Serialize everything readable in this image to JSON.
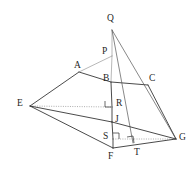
{
  "figure": {
    "background_color": "#ffffff",
    "stroke_color": "#2b2b2b",
    "light_stroke_color": "#9a9a9a",
    "width": 196,
    "height": 169,
    "points": [
      {
        "id": "Q",
        "label": "Q",
        "x": 112,
        "y": 30,
        "label_x": 107,
        "label_y": 14
      },
      {
        "id": "P",
        "label": "P",
        "x": 112,
        "y": 56,
        "label_x": 102,
        "label_y": 47
      },
      {
        "id": "A",
        "label": "A",
        "x": 79,
        "y": 72,
        "label_x": 74,
        "label_y": 61
      },
      {
        "id": "B",
        "label": "B",
        "x": 111,
        "y": 82,
        "label_x": 103,
        "label_y": 74
      },
      {
        "id": "C",
        "label": "C",
        "x": 148,
        "y": 85,
        "label_x": 149,
        "label_y": 74
      },
      {
        "id": "E",
        "label": "E",
        "x": 30,
        "y": 106,
        "label_x": 17,
        "label_y": 99
      },
      {
        "id": "R",
        "label": "R",
        "x": 112,
        "y": 107,
        "label_x": 116,
        "label_y": 99
      },
      {
        "id": "J",
        "label": "J",
        "x": 112,
        "y": 122,
        "label_x": 115,
        "label_y": 115
      },
      {
        "id": "S",
        "label": "S",
        "x": 113,
        "y": 139,
        "label_x": 103,
        "label_y": 132
      },
      {
        "id": "G",
        "label": "G",
        "x": 176,
        "y": 139,
        "label_x": 179,
        "label_y": 133
      },
      {
        "id": "T",
        "label": "T",
        "x": 133,
        "y": 143,
        "label_x": 134,
        "label_y": 148
      },
      {
        "id": "F",
        "label": "F",
        "x": 113,
        "y": 148,
        "label_x": 108,
        "label_y": 152
      }
    ],
    "edges": [
      {
        "name": "edge-E-A",
        "from": "E",
        "to": "A",
        "style": "solid"
      },
      {
        "name": "edge-A-B",
        "from": "A",
        "to": "B",
        "style": "solid"
      },
      {
        "name": "edge-A-P",
        "from": "A",
        "to": "P",
        "style": "light"
      },
      {
        "name": "edge-B-C",
        "from": "B",
        "to": "C",
        "style": "solid"
      },
      {
        "name": "edge-C-G",
        "from": "C",
        "to": "G",
        "style": "solid"
      },
      {
        "name": "edge-Q-P",
        "from": "Q",
        "to": "P",
        "style": "light"
      },
      {
        "name": "edge-P-B",
        "from": "P",
        "to": "B",
        "style": "light"
      },
      {
        "name": "edge-B-R",
        "from": "B",
        "to": "R",
        "style": "solid"
      },
      {
        "name": "edge-R-J",
        "from": "R",
        "to": "J",
        "style": "solid"
      },
      {
        "name": "edge-J-S",
        "from": "J",
        "to": "S",
        "style": "solid"
      },
      {
        "name": "edge-S-F",
        "from": "S",
        "to": "F",
        "style": "solid"
      },
      {
        "name": "edge-Q-T",
        "from": "Q",
        "to": "T",
        "style": "thin"
      },
      {
        "name": "edge-Q-G",
        "from": "Q",
        "to": "G",
        "style": "thin"
      },
      {
        "name": "edge-E-R",
        "from": "E",
        "to": "R",
        "style": "dotted"
      },
      {
        "name": "edge-E-J",
        "from": "E",
        "to": "J",
        "style": "solid"
      },
      {
        "name": "edge-E-F",
        "from": "E",
        "to": "F",
        "style": "solid"
      },
      {
        "name": "edge-J-G",
        "from": "J",
        "to": "G",
        "style": "solid"
      },
      {
        "name": "edge-S-G",
        "from": "S",
        "to": "G",
        "style": "dotted"
      },
      {
        "name": "edge-F-G",
        "from": "F",
        "to": "G",
        "style": "solid"
      },
      {
        "name": "edge-C-Bmid",
        "from": "C",
        "to": "B",
        "style": "none"
      }
    ],
    "right_angles": [
      {
        "name": "right-angle-R",
        "at": "R",
        "x": 105,
        "y": 101,
        "size": 6,
        "orient": "bottom-right"
      },
      {
        "name": "right-angle-S",
        "at": "S",
        "x": 113,
        "y": 133,
        "size": 6,
        "orient": "bottom-right"
      },
      {
        "name": "right-angle-T",
        "at": "T",
        "x": 127,
        "y": 136,
        "size": 7,
        "orient": "tilted"
      }
    ]
  }
}
